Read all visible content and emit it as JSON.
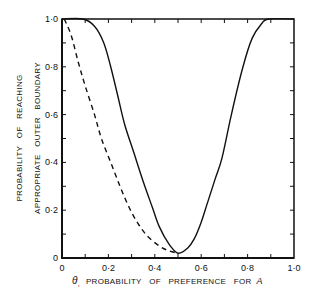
{
  "chart_data": {
    "type": "line",
    "title": "",
    "xlabel": "θ, PROBABILITY OF PREFERENCE FOR A",
    "xlabel_parts": {
      "symbol": "θ",
      "sub": ",",
      "text": "PROBABILITY   OF   PREFERENCE   FOR",
      "italic_var": "A"
    },
    "ylabel_line1": "PROBABILITY   OF   REACHING",
    "ylabel_line2": "APPROPRIATE   OUTER   BOUNDARY",
    "xlim": [
      0,
      1.0
    ],
    "ylim": [
      0,
      1.0
    ],
    "x_tick_labels": [
      "0",
      "0·2",
      "0·4",
      "0·6",
      "0·8",
      "1·0"
    ],
    "y_tick_labels": [
      "0",
      "0·2",
      "0·4",
      "0·6",
      "0·8",
      "1·0"
    ],
    "grid": false,
    "legend": null,
    "series": [
      {
        "name": "solid",
        "style": "solid",
        "x": [
          0.0,
          0.09,
          0.14,
          0.18,
          0.21,
          0.24,
          0.27,
          0.31,
          0.35,
          0.39,
          0.42,
          0.46,
          0.5,
          0.54,
          0.57,
          0.6,
          0.63,
          0.66,
          0.69,
          0.73,
          0.78,
          0.82,
          0.86,
          0.89,
          1.0
        ],
        "y": [
          1.0,
          1.0,
          0.97,
          0.9,
          0.8,
          0.68,
          0.56,
          0.44,
          0.32,
          0.21,
          0.13,
          0.06,
          0.02,
          0.04,
          0.08,
          0.15,
          0.24,
          0.33,
          0.42,
          0.6,
          0.8,
          0.92,
          0.98,
          1.0,
          1.0
        ]
      },
      {
        "name": "dashed",
        "style": "dashed",
        "x": [
          0.01,
          0.04,
          0.07,
          0.1,
          0.14,
          0.17,
          0.21,
          0.25,
          0.29,
          0.33,
          0.37,
          0.42,
          0.46,
          0.5
        ],
        "y": [
          1.0,
          0.93,
          0.82,
          0.72,
          0.6,
          0.5,
          0.4,
          0.3,
          0.21,
          0.14,
          0.09,
          0.05,
          0.03,
          0.02
        ]
      }
    ]
  }
}
